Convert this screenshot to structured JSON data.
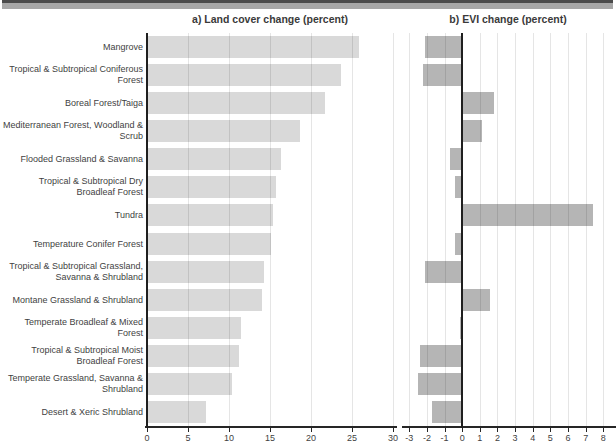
{
  "window": {
    "top_strip": "decorative gray bar"
  },
  "chart_data": {
    "type": "bar",
    "orientation": "horizontal",
    "grid": true,
    "legend": false,
    "categories": [
      "Mangrove",
      "Tropical & Subtropical Coniferous Forest",
      "Boreal Forest/Taiga",
      "Mediterranean Forest, Woodland & Scrub",
      "Flooded Grassland & Savanna",
      "Tropical & Subtropical Dry Broadleaf Forest",
      "Tundra",
      "Temperature Conifer Forest",
      "Tropical & Subtropical Grassland, Savanna & Shrubland",
      "Montane Grassland & Shrubland",
      "Temperate Broadleaf & Mixed Forest",
      "Tropical & Subtropical Moist Broadleaf Forest",
      "Temperate Grassland, Savanna & Shrubland",
      "Desert & Xeric Shrubland"
    ],
    "panels": [
      {
        "title": "a) Land cover change (percent)",
        "values": [
          25.8,
          23.7,
          21.7,
          18.6,
          16.4,
          15.7,
          15.4,
          15.1,
          14.3,
          14.0,
          11.5,
          11.2,
          10.4,
          7.2
        ],
        "axis_range": [
          0,
          30
        ],
        "ticks": [
          0,
          5,
          10,
          15,
          20,
          25,
          30
        ],
        "bar_color": "#d9d9d9"
      },
      {
        "title": "b) EVI change (percent)",
        "values": [
          -2.1,
          -2.2,
          1.8,
          1.1,
          -0.7,
          -0.4,
          7.4,
          -0.4,
          -2.1,
          1.6,
          -0.1,
          -2.4,
          -2.5,
          -1.7
        ],
        "axis_range": [
          -3.3,
          8.55
        ],
        "ticks": [
          -3,
          -2,
          -1,
          0,
          1,
          2,
          3,
          4,
          5,
          6,
          7,
          8
        ],
        "bar_color": "#b5b5b5"
      }
    ],
    "colors": {
      "axis": "#262626",
      "gridline": "#e4e4e4",
      "text": "#3f3f3f"
    }
  }
}
